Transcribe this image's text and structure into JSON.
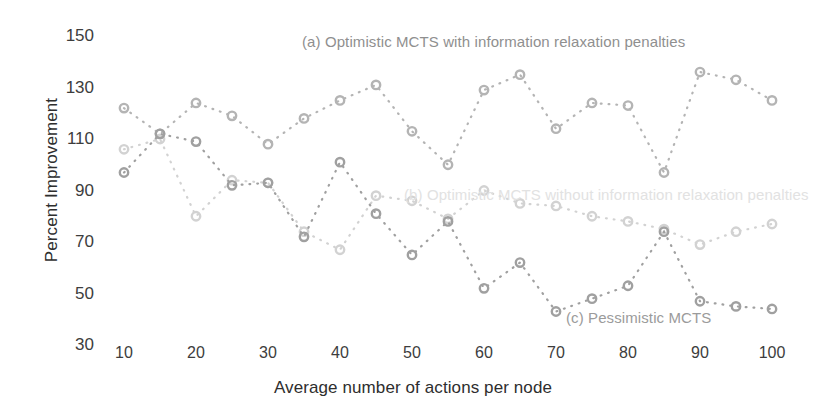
{
  "chart_data": {
    "type": "scatter",
    "title": "",
    "xlabel": "Average number of actions per node",
    "ylabel": "Percent Improvement",
    "xlim": [
      5,
      104
    ],
    "ylim": [
      30,
      150
    ],
    "xticks": [
      10,
      20,
      30,
      40,
      50,
      60,
      70,
      80,
      90,
      100
    ],
    "yticks": [
      30,
      50,
      70,
      90,
      110,
      130,
      150
    ],
    "grid": false,
    "legend_position": "inline-annotations",
    "marker": "circle-dotted-line",
    "x": [
      10,
      15,
      20,
      25,
      30,
      35,
      40,
      45,
      50,
      55,
      60,
      65,
      70,
      75,
      80,
      85,
      90,
      95,
      100
    ],
    "series": [
      {
        "name": "(a) Optimistic MCTS with information relaxation penalties",
        "color": "#b4b4b4",
        "values": [
          122,
          112,
          124,
          119,
          108,
          118,
          125,
          131,
          113,
          100,
          129,
          135,
          114,
          124,
          123,
          97,
          136,
          133,
          125
        ]
      },
      {
        "name": "(b) Optimistic MCTS without information relaxation penalties",
        "color": "#d2d2d2",
        "values": [
          106,
          110,
          80,
          94,
          93,
          74,
          67,
          88,
          86,
          79,
          90,
          85,
          84,
          80,
          78,
          75,
          69,
          74,
          77
        ]
      },
      {
        "name": "(c) Pessimistic MCTS",
        "color": "#a0a0a0",
        "values": [
          97,
          112,
          109,
          92,
          93,
          72,
          101,
          81,
          65,
          78,
          52,
          62,
          43,
          48,
          53,
          74,
          47,
          45,
          44
        ]
      }
    ],
    "annotations": [
      {
        "id": "a",
        "text": "(a) Optimistic MCTS with information relaxation penalties"
      },
      {
        "id": "b",
        "text": "(b) Optimistic MCTS without information relaxation penalties"
      },
      {
        "id": "c",
        "text": "(c) Pessimistic MCTS"
      }
    ]
  },
  "axes": {
    "y_title": "Percent Improvement",
    "x_title": "Average number of actions per node",
    "y_tick_labels": [
      "150",
      "130",
      "110",
      "90",
      "70",
      "50",
      "30"
    ],
    "x_tick_labels": [
      "10",
      "20",
      "30",
      "40",
      "50",
      "60",
      "70",
      "80",
      "90",
      "100"
    ]
  },
  "annotations": {
    "a": "(a) Optimistic MCTS with information relaxation penalties",
    "b": "(b) Optimistic MCTS without information relaxation penalties",
    "c": "(c) Pessimistic MCTS"
  }
}
